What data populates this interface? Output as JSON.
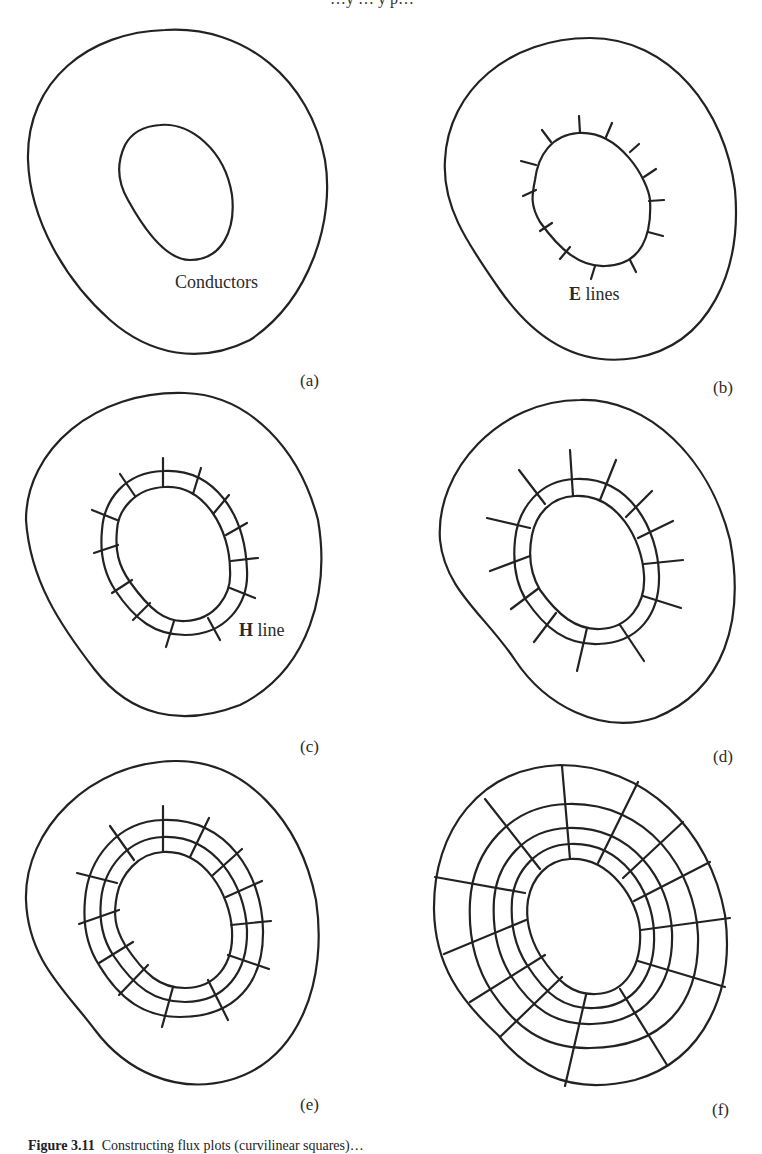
{
  "figure": {
    "top_cut_text": "…y … y p…",
    "caption_prefix": "Figure 3.11",
    "caption_text": "Constructing flux plots (curvilinear squares)…",
    "panels": [
      {
        "id": "a",
        "label": "(a)",
        "annotation": "Conductors",
        "description": "Two conductors: outer closed boundary and inner oval conductor"
      },
      {
        "id": "b",
        "label": "(b)",
        "annotation_bold": "E",
        "annotation_rest": " lines",
        "description": "Short E-field line stubs drawn normal to inner conductor",
        "e_line_count": 14
      },
      {
        "id": "c",
        "label": "(c)",
        "annotation_bold": "H",
        "annotation_rest": " line",
        "description": "First H (equipotential) line drawn, forming curvilinear squares",
        "h_line_count": 1
      },
      {
        "id": "d",
        "label": "(d)",
        "description": "E lines extended beyond the first H line",
        "h_line_count": 1
      },
      {
        "id": "e",
        "label": "(e)",
        "description": "Second H line added, E lines extended",
        "h_line_count": 2
      },
      {
        "id": "f",
        "label": "(f)",
        "description": "Completed flux plot of curvilinear squares between the conductors",
        "h_line_count": 4
      }
    ]
  }
}
